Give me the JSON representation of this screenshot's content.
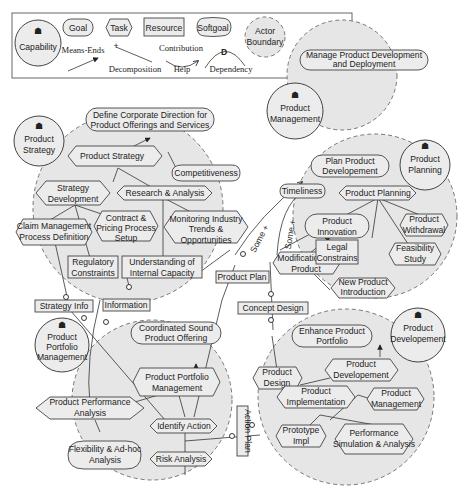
{
  "legend": {
    "capability": "Capability",
    "goal": "Goal",
    "task": "Task",
    "resource": "Resource",
    "softgoal": "Softgoal",
    "actor_boundary_1": "Actor",
    "actor_boundary_2": "Boundary",
    "means_ends": "Means-Ends",
    "decomposition": "Decomposition",
    "contribution": "Contribution",
    "help": "Help",
    "dependency": "Dependency",
    "dependency_mark": "D"
  },
  "actors": {
    "product_management": [
      "Product",
      "Management"
    ],
    "product_strategy": [
      "Product",
      "Strategy"
    ],
    "product_planning": [
      "Product",
      "Planning"
    ],
    "product_portfolio_management": [
      "Product",
      "Portfolio",
      "Management"
    ],
    "product_development": [
      "Product",
      "Developement"
    ]
  },
  "goals": {
    "manage_pdd": [
      "Manage Product Development",
      "and Deployment"
    ],
    "define_corporate": [
      "Define Corporate Direction for",
      "Product Offerings and Services"
    ],
    "plan_product_dev": [
      "Plan Product",
      "Developement"
    ],
    "product_innovation": [
      "Product",
      "Innovation"
    ],
    "coordinated_offering": [
      "Coordinated Sound",
      "Product Offering"
    ],
    "enhance_portfolio": [
      "Enhance Product",
      "Portfolio"
    ]
  },
  "softgoals": {
    "competitiveness": "Competitiveness",
    "timeliness": "Timeliness",
    "flexibility": [
      "Flexibility & Ad-hoc",
      "Analysis"
    ]
  },
  "tasks": {
    "product_strategy": "Product Strategy",
    "strategy_development": [
      "Strategy",
      "Development"
    ],
    "research_analysis": "Research & Analysis",
    "claim_mgmt": [
      "Claim Management",
      "Process Definition"
    ],
    "contract_pricing": [
      "Contract &",
      "Pricing Process",
      "Setup"
    ],
    "monitoring": [
      "Monitoring Industry",
      "Trends &",
      "Opportunities"
    ],
    "product_planning": "Product Planning",
    "product_withdrawal": [
      "Product",
      "Withdrawal"
    ],
    "feasibility": [
      "Feasibility",
      "Study"
    ],
    "modification": [
      "Modification Of",
      "Product"
    ],
    "new_product": [
      "New Product",
      "Introduction"
    ],
    "portfolio_mgmt": [
      "Product Portfolio",
      "Management"
    ],
    "performance_analysis": [
      "Product Performance",
      "Analysis"
    ],
    "identify_action": "Identify Action",
    "risk_analysis": "Risk Analysis",
    "product_design": [
      "Product",
      "Design"
    ],
    "product_development": [
      "Product",
      "Developement"
    ],
    "product_implementation": [
      "Product",
      "Implementation"
    ],
    "product_management": [
      "Product",
      "Management"
    ],
    "prototype": [
      "Prototype",
      "Impl"
    ],
    "performance_sim": [
      "Performance",
      "Simulation & Analysis"
    ]
  },
  "resources": {
    "regulatory": [
      "Regulatory",
      "Constraints"
    ],
    "understanding": [
      "Understanding of",
      "Internal Capacity"
    ],
    "legal": [
      "Legal",
      "Constrains"
    ],
    "strategy_info": "Strategy Info",
    "information": "Information",
    "product_plan": "Product Plan",
    "concept_design": "Concept Design",
    "action_plan": "Action Plan"
  },
  "contributions": {
    "some_plus_1": "Some +",
    "some_plus_2": "Some +"
  }
}
